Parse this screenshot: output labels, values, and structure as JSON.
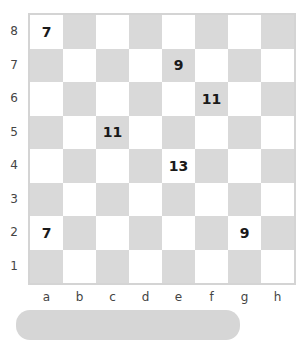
{
  "board": {
    "files": [
      "a",
      "b",
      "c",
      "d",
      "e",
      "f",
      "g",
      "h"
    ],
    "ranks": [
      "8",
      "7",
      "6",
      "5",
      "4",
      "3",
      "2",
      "1"
    ],
    "colors": {
      "light": "#ffffff",
      "dark": "#d9d9d9",
      "border": "#d4d4d4"
    },
    "marks": [
      {
        "square": "a8",
        "value": "7"
      },
      {
        "square": "e7",
        "value": "9"
      },
      {
        "square": "f6",
        "value": "11"
      },
      {
        "square": "c5",
        "value": "11"
      },
      {
        "square": "e4",
        "value": "13"
      },
      {
        "square": "a2",
        "value": "7"
      },
      {
        "square": "g2",
        "value": "9"
      }
    ]
  }
}
